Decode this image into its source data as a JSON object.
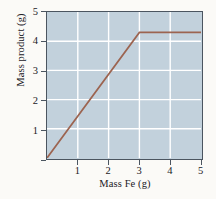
{
  "chart_data": {
    "type": "line",
    "title": "",
    "xlabel": "Mass Fe (g)",
    "ylabel": "Mass product (g)",
    "xlim": [
      0,
      5
    ],
    "ylim": [
      0,
      5
    ],
    "xticks": [
      "1",
      "2",
      "3",
      "4",
      "5"
    ],
    "xtick_values": [
      1,
      2,
      3,
      4,
      5
    ],
    "yticks": [
      "1",
      "2",
      "3",
      "4",
      "5"
    ],
    "ytick_values": [
      1,
      2,
      3,
      4,
      5
    ],
    "grid": true,
    "grid_color": "#ffffff",
    "legend": null,
    "plot_bgcolor": "#c2d1dc",
    "figure_bgcolor": "#fbfaf7",
    "axis_color": "#4b5560",
    "series": [
      {
        "name": "Mass product vs mass Fe",
        "color": "#9c6450",
        "x": [
          0,
          3,
          5
        ],
        "y": [
          0,
          4.3,
          4.3
        ],
        "description": "Linear rise from origin to the limiting-reactant breakpoint at (3 g Fe, 4.3 g product), then constant plateau at 4.3 g through 5 g Fe."
      }
    ]
  },
  "axes": {
    "y_title": "Mass product (g)",
    "x_title": "Mass Fe (g)",
    "y_tick_labels": [
      "1",
      "2",
      "3",
      "4",
      "5"
    ],
    "x_tick_labels": [
      "1",
      "2",
      "3",
      "4",
      "5"
    ]
  }
}
